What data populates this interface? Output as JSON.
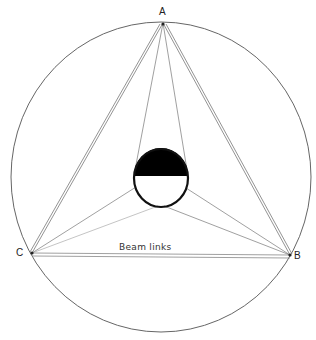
{
  "diagram": {
    "title": "",
    "labels": {
      "vertex_a": "A",
      "vertex_b": "B",
      "vertex_c": "C",
      "beam_links": "Beam links"
    },
    "colors": {
      "line": "#6a6a6a",
      "circle": "#555555",
      "fill": "#000000",
      "background": "#ffffff"
    },
    "elements": [
      {
        "type": "circle",
        "name": "outer-circle",
        "center": [
          161,
          177
        ],
        "radius": 152
      },
      {
        "type": "triangle",
        "name": "triangle-abc",
        "vertices": {
          "A": [
            163,
            23
          ],
          "B": [
            290,
            255
          ],
          "C": [
            32,
            253
          ]
        },
        "edges": "double lines"
      },
      {
        "type": "circle",
        "name": "inner-circle",
        "center": [
          161,
          178
        ],
        "radius": 28,
        "upper_half_filled": true
      },
      {
        "type": "line",
        "from": "A",
        "to": "inner-circle-left-tangent"
      },
      {
        "type": "line",
        "from": "A",
        "to": "inner-circle-right-tangent"
      },
      {
        "type": "line",
        "from": "C",
        "to": "inner-circle-left"
      },
      {
        "type": "line",
        "from": "C",
        "to": "inner-circle-bottom"
      },
      {
        "type": "line",
        "from": "B",
        "to": "inner-circle-right"
      },
      {
        "type": "line",
        "from": "B",
        "to": "inner-circle-bottom"
      }
    ]
  }
}
